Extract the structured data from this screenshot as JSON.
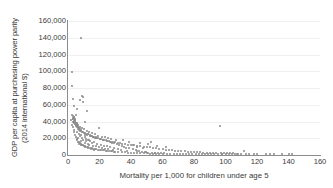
{
  "chart_data": {
    "type": "scatter",
    "title": "",
    "xlabel": "Mortality per 1,000 for children under age 5",
    "ylabel_line1": "GDP per capita at purchasing power parity",
    "ylabel_line2": "(2014 international $)",
    "xlim": [
      0,
      160
    ],
    "ylim": [
      0,
      160000
    ],
    "xticks": [
      0,
      20,
      40,
      60,
      80,
      100,
      120,
      140,
      160
    ],
    "xtick_labels": [
      "0",
      "20",
      "40",
      "60",
      "80",
      "100",
      "120",
      "140",
      "160"
    ],
    "yticks": [
      0,
      20000,
      40000,
      60000,
      80000,
      100000,
      120000,
      140000,
      160000
    ],
    "ytick_labels": [
      "0",
      "20,000",
      "40,000",
      "60,000",
      "80,000",
      "100,000",
      "120,000",
      "140,000",
      "160,000"
    ],
    "grid": "horizontal",
    "legend": null,
    "marker_color": "#8a8a8a",
    "axis_color": "#8c8c8c",
    "gridline_color": "#f0f0f0",
    "text_color": "#3a3a3a",
    "points": [
      [
        8.2,
        140000
      ],
      [
        2.4,
        99000
      ],
      [
        2.6,
        82000
      ],
      [
        3.1,
        66500
      ],
      [
        8.7,
        70500
      ],
      [
        9.8,
        69500
      ],
      [
        7.6,
        66000
      ],
      [
        9.3,
        63000
      ],
      [
        4.0,
        58000
      ],
      [
        5.6,
        55500
      ],
      [
        12.0,
        52000
      ],
      [
        5.2,
        47500
      ],
      [
        10.5,
        40000
      ],
      [
        3.2,
        46000
      ],
      [
        3.5,
        45000
      ],
      [
        3.8,
        44000
      ],
      [
        3.4,
        43000
      ],
      [
        4.2,
        42500
      ],
      [
        3.0,
        44500
      ],
      [
        2.9,
        43500
      ],
      [
        3.6,
        41000
      ],
      [
        4.4,
        40500
      ],
      [
        4.6,
        39500
      ],
      [
        3.9,
        38500
      ],
      [
        4.8,
        38000
      ],
      [
        5.0,
        37500
      ],
      [
        5.4,
        36500
      ],
      [
        3.3,
        40000
      ],
      [
        4.1,
        39000
      ],
      [
        4.5,
        37000
      ],
      [
        5.8,
        35500
      ],
      [
        6.0,
        35000
      ],
      [
        6.3,
        34000
      ],
      [
        4.9,
        36000
      ],
      [
        5.5,
        33500
      ],
      [
        6.6,
        33000
      ],
      [
        7.0,
        32000
      ],
      [
        5.1,
        34500
      ],
      [
        6.8,
        31500
      ],
      [
        7.4,
        30500
      ],
      [
        19.5,
        32000
      ],
      [
        8.0,
        29500
      ],
      [
        8.5,
        29000
      ],
      [
        6.2,
        31000
      ],
      [
        7.8,
        28500
      ],
      [
        9.0,
        28000
      ],
      [
        9.5,
        27000
      ],
      [
        10.0,
        26500
      ],
      [
        10.8,
        26000
      ],
      [
        7.2,
        30000
      ],
      [
        11.5,
        25500
      ],
      [
        12.5,
        25000
      ],
      [
        13.0,
        24500
      ],
      [
        11.0,
        24000
      ],
      [
        13.8,
        23500
      ],
      [
        14.5,
        23000
      ],
      [
        15.2,
        22500
      ],
      [
        12.2,
        23800
      ],
      [
        16.0,
        22000
      ],
      [
        16.8,
        21500
      ],
      [
        17.5,
        21000
      ],
      [
        14.0,
        22800
      ],
      [
        18.3,
        20500
      ],
      [
        19.0,
        20000
      ],
      [
        20.0,
        19500
      ],
      [
        15.8,
        21800
      ],
      [
        21.0,
        19000
      ],
      [
        22.0,
        18500
      ],
      [
        23.0,
        18000
      ],
      [
        17.0,
        20800
      ],
      [
        24.0,
        17500
      ],
      [
        25.0,
        17000
      ],
      [
        26.0,
        16500
      ],
      [
        18.0,
        19800
      ],
      [
        27.0,
        16000
      ],
      [
        28.5,
        15500
      ],
      [
        30.0,
        15000
      ],
      [
        20.5,
        18800
      ],
      [
        31.5,
        14500
      ],
      [
        33.0,
        14000
      ],
      [
        34.5,
        13500
      ],
      [
        22.5,
        17800
      ],
      [
        36.0,
        13000
      ],
      [
        38.0,
        12500
      ],
      [
        40.0,
        12000
      ],
      [
        24.5,
        16800
      ],
      [
        42.0,
        11500
      ],
      [
        44.0,
        11000
      ],
      [
        46.0,
        10500
      ],
      [
        26.5,
        15800
      ],
      [
        48.0,
        10000
      ],
      [
        50.0,
        9500
      ],
      [
        52.0,
        9000
      ],
      [
        28.0,
        14800
      ],
      [
        54.0,
        8500
      ],
      [
        56.0,
        8000
      ],
      [
        58.0,
        7500
      ],
      [
        29.5,
        13800
      ],
      [
        60.0,
        7000
      ],
      [
        62.0,
        6500
      ],
      [
        64.0,
        6000
      ],
      [
        31.0,
        12800
      ],
      [
        66.0,
        5500
      ],
      [
        68.0,
        5000
      ],
      [
        70.0,
        4800
      ],
      [
        32.5,
        11800
      ],
      [
        72.0,
        4500
      ],
      [
        74.0,
        4200
      ],
      [
        76.0,
        4000
      ],
      [
        34.0,
        10800
      ],
      [
        78.0,
        3800
      ],
      [
        80.0,
        3500
      ],
      [
        82.0,
        3300
      ],
      [
        35.5,
        9800
      ],
      [
        84.0,
        3100
      ],
      [
        86.0,
        2900
      ],
      [
        88.0,
        2700
      ],
      [
        37.0,
        8800
      ],
      [
        90.0,
        2500
      ],
      [
        92.0,
        2400
      ],
      [
        94.0,
        2300
      ],
      [
        39.0,
        7800
      ],
      [
        96.5,
        35000
      ],
      [
        97.0,
        2200
      ],
      [
        99.0,
        2100
      ],
      [
        41.0,
        6800
      ],
      [
        101.0,
        2000
      ],
      [
        103.0,
        1900
      ],
      [
        105.0,
        1800
      ],
      [
        43.0,
        5800
      ],
      [
        107.0,
        1700
      ],
      [
        112.0,
        5200
      ],
      [
        113.0,
        1600
      ],
      [
        45.0,
        4800
      ],
      [
        118.0,
        1500
      ],
      [
        125.5,
        1400
      ],
      [
        131.0,
        1300
      ],
      [
        47.0,
        3800
      ],
      [
        142.5,
        1200
      ],
      [
        49.0,
        3200
      ],
      [
        51.0,
        2800
      ],
      [
        53.0,
        16000
      ],
      [
        53.5,
        2400
      ],
      [
        55.0,
        2200
      ],
      [
        57.0,
        2000
      ],
      [
        59.0,
        1900
      ],
      [
        61.0,
        1800
      ],
      [
        63.0,
        1700
      ],
      [
        65.0,
        1600
      ],
      [
        67.0,
        1500
      ],
      [
        69.0,
        1400
      ],
      [
        71.0,
        1350
      ],
      [
        73.0,
        1300
      ],
      [
        75.0,
        1250
      ],
      [
        77.0,
        1200
      ],
      [
        79.0,
        1150
      ],
      [
        81.0,
        1100
      ],
      [
        83.0,
        1050
      ],
      [
        85.0,
        1000
      ],
      [
        87.0,
        980
      ],
      [
        89.0,
        950
      ],
      [
        91.0,
        920
      ],
      [
        93.0,
        900
      ],
      [
        95.0,
        880
      ],
      [
        98.0,
        860
      ],
      [
        100.0,
        840
      ],
      [
        102.0,
        820
      ],
      [
        104.0,
        800
      ],
      [
        106.0,
        780
      ],
      [
        45.5,
        14800
      ],
      [
        50.5,
        13000
      ],
      [
        56.5,
        11000
      ],
      [
        62.5,
        9500
      ],
      [
        41.5,
        12000
      ],
      [
        38.5,
        15500
      ],
      [
        35.0,
        17500
      ],
      [
        44.0,
        9800
      ],
      [
        47.5,
        8500
      ],
      [
        30.5,
        18200
      ],
      [
        27.5,
        19000
      ],
      [
        25.5,
        20500
      ],
      [
        23.5,
        21200
      ],
      [
        21.5,
        22000
      ],
      [
        19.2,
        23000
      ],
      [
        17.2,
        24500
      ],
      [
        15.0,
        26000
      ],
      [
        13.5,
        27500
      ],
      [
        11.8,
        29000
      ],
      [
        10.2,
        30500
      ],
      [
        8.8,
        32000
      ],
      [
        7.5,
        33500
      ],
      [
        6.5,
        36000
      ],
      [
        5.7,
        38000
      ],
      [
        4.7,
        41500
      ],
      [
        3.7,
        45500
      ],
      [
        2.8,
        48000
      ],
      [
        2.2,
        42000
      ],
      [
        2.5,
        36000
      ],
      [
        3.0,
        33000
      ],
      [
        3.5,
        30000
      ],
      [
        4.0,
        27000
      ],
      [
        4.5,
        24000
      ],
      [
        5.0,
        21000
      ],
      [
        5.5,
        19000
      ],
      [
        6.0,
        17500
      ],
      [
        6.5,
        16000
      ],
      [
        7.0,
        15000
      ],
      [
        7.5,
        14000
      ],
      [
        8.0,
        13000
      ],
      [
        8.5,
        12500
      ],
      [
        9.0,
        12000
      ],
      [
        9.5,
        11500
      ],
      [
        10.0,
        11000
      ],
      [
        10.5,
        10500
      ],
      [
        11.0,
        10000
      ],
      [
        12.0,
        9500
      ],
      [
        13.0,
        9000
      ],
      [
        14.0,
        8500
      ],
      [
        15.0,
        8000
      ],
      [
        16.0,
        7500
      ],
      [
        17.0,
        7000
      ],
      [
        18.0,
        6800
      ],
      [
        19.0,
        6500
      ],
      [
        20.0,
        6200
      ],
      [
        21.0,
        6000
      ],
      [
        22.0,
        5800
      ],
      [
        23.0,
        5500
      ],
      [
        24.0,
        5200
      ],
      [
        25.0,
        5000
      ],
      [
        26.0,
        4800
      ],
      [
        27.0,
        4500
      ],
      [
        28.0,
        4200
      ],
      [
        29.0,
        4000
      ],
      [
        30.0,
        3800
      ],
      [
        32.0,
        3500
      ],
      [
        34.0,
        3200
      ],
      [
        36.0,
        3000
      ],
      [
        38.0,
        2800
      ],
      [
        40.0,
        2600
      ],
      [
        42.0,
        2400
      ],
      [
        44.0,
        2200
      ],
      [
        46.0,
        2000
      ],
      [
        48.0,
        1900
      ],
      [
        50.0,
        1800
      ],
      [
        52.0,
        1700
      ],
      [
        54.0,
        1600
      ],
      [
        56.0,
        1500
      ],
      [
        58.0,
        1400
      ],
      [
        60.0,
        1300
      ],
      [
        12.6,
        18500
      ],
      [
        14.2,
        16800
      ],
      [
        16.5,
        15200
      ],
      [
        9.2,
        20200
      ],
      [
        11.2,
        19200
      ],
      [
        13.2,
        17800
      ],
      [
        15.5,
        14200
      ],
      [
        18.5,
        13200
      ],
      [
        20.8,
        12200
      ],
      [
        22.8,
        11200
      ],
      [
        24.8,
        10200
      ],
      [
        26.8,
        9200
      ],
      [
        29.0,
        8200
      ],
      [
        31.5,
        7200
      ],
      [
        33.5,
        6200
      ],
      [
        37.5,
        5200
      ],
      [
        43.5,
        4200
      ],
      [
        49.5,
        3400
      ],
      [
        55.5,
        2600
      ],
      [
        12.8,
        7800
      ],
      [
        14.8,
        6800
      ],
      [
        16.2,
        5800
      ],
      [
        7.9,
        22500
      ],
      [
        6.9,
        25500
      ],
      [
        5.9,
        28000
      ],
      [
        8.3,
        24000
      ],
      [
        10.6,
        21500
      ],
      [
        11.6,
        16200
      ],
      [
        9.7,
        18000
      ],
      [
        12.9,
        13500
      ],
      [
        8.1,
        17000
      ],
      [
        6.4,
        20000
      ],
      [
        7.1,
        13000
      ],
      [
        10.9,
        14500
      ],
      [
        13.6,
        12200
      ],
      [
        15.6,
        11200
      ],
      [
        17.6,
        10200
      ],
      [
        19.6,
        9200
      ],
      [
        21.6,
        8200
      ],
      [
        23.6,
        7400
      ],
      [
        25.6,
        6600
      ],
      [
        28.6,
        5900
      ],
      [
        97.5,
        1000
      ],
      [
        108.0,
        900
      ],
      [
        110.0,
        850
      ],
      [
        115.0,
        800
      ],
      [
        120.0,
        750
      ],
      [
        128.0,
        700
      ],
      [
        136.0,
        650
      ],
      [
        140.0,
        600
      ]
    ]
  }
}
